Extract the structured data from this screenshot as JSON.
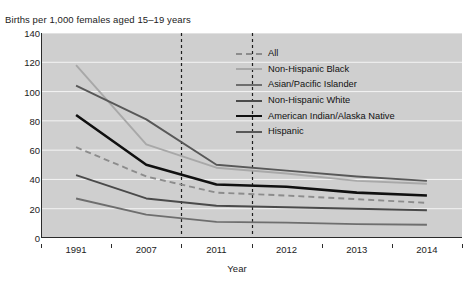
{
  "chart_data": {
    "type": "line",
    "title": "Births per 1,000 females aged 15–19 years",
    "ylabel": "Births per 1,000 females aged 15–19 years",
    "xlabel": "Year",
    "categories": [
      "1991",
      "2007",
      "2011",
      "2012",
      "2013",
      "2014"
    ],
    "ylim": [
      0,
      140
    ],
    "yticks": [
      0,
      20,
      40,
      60,
      80,
      100,
      120,
      140
    ],
    "ytick_labels": [
      "0",
      "20",
      "40",
      "60",
      "80",
      "100",
      "120",
      "140"
    ],
    "grid": true,
    "legend_position": "top-right-inside",
    "reference_lines": [
      "2007",
      "2011"
    ],
    "series": [
      {
        "name": "All",
        "style": "dashed",
        "color": "#8c8c8c",
        "width": 1.9,
        "values": [
          62,
          42,
          31,
          29,
          26.5,
          24
        ]
      },
      {
        "name": "Non-Hispanic Black",
        "style": "solid",
        "color": "#a8a8a8",
        "width": 1.9,
        "values": [
          118,
          64,
          48,
          44,
          39,
          37
        ]
      },
      {
        "name": "Asian/Pacific Islander",
        "style": "solid",
        "color": "#6e6e6e",
        "width": 1.9,
        "values": [
          27,
          16,
          11,
          10.5,
          9.5,
          9
        ]
      },
      {
        "name": "Non-Hispanic White",
        "style": "solid",
        "color": "#4a4a4a",
        "width": 1.9,
        "values": [
          43,
          27,
          22,
          21,
          20,
          19
        ]
      },
      {
        "name": "American Indian/Alaska Native",
        "style": "solid",
        "color": "#101010",
        "width": 2.6,
        "values": [
          84,
          50,
          36.5,
          35,
          31,
          29
        ]
      },
      {
        "name": "Hispanic",
        "style": "solid",
        "color": "#585858",
        "width": 1.9,
        "values": [
          104,
          81,
          50,
          46,
          42,
          39
        ]
      }
    ]
  },
  "legend": {
    "entries": [
      {
        "label": "All"
      },
      {
        "label": "Non-Hispanic Black"
      },
      {
        "label": "Asian/Pacific Islander"
      },
      {
        "label": "Non-Hispanic White"
      },
      {
        "label": "American Indian/Alaska Native"
      },
      {
        "label": "Hispanic"
      }
    ]
  },
  "colors": {
    "plot_background": "#cfcfcf",
    "grid": "#f2f2f2",
    "axis": "#2b2b2b",
    "page_background": "#ffffff"
  }
}
